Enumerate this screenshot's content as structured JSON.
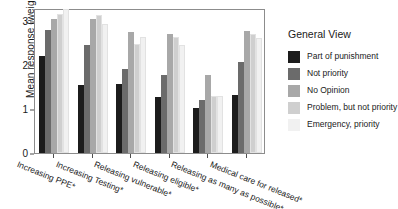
{
  "chart_data": {
    "type": "bar",
    "title": "",
    "xlabel": "",
    "ylabel": "Mean response (weighted)",
    "ylim": [
      0,
      3.3
    ],
    "yticks": [
      0,
      1,
      2,
      3
    ],
    "ytick_labels": [
      "0",
      "1",
      "2",
      "3"
    ],
    "grid": false,
    "legend_position": "right",
    "legend_title": "General View",
    "categories": [
      "Increasing PPE*",
      "Increasing Testing*",
      "Releasing vulnerable*",
      "Releasing eligible*",
      "Releasing as many as possible*",
      "Medical care for released*"
    ],
    "series": [
      {
        "name": "Part of punishment",
        "color": "#1c1c1c",
        "values": [
          2.2,
          1.55,
          1.58,
          1.28,
          1.02,
          1.32
        ]
      },
      {
        "name": "Not priority",
        "color": "#6b6b6b",
        "values": [
          2.79,
          2.45,
          1.91,
          1.77,
          1.2,
          2.08
        ]
      },
      {
        "name": "No Opinion",
        "color": "#a8a8a8",
        "values": [
          3.05,
          3.05,
          2.75,
          2.72,
          1.78,
          2.78
        ]
      },
      {
        "name": "Problem, but not priority",
        "color": "#cfcfcf",
        "values": [
          3.16,
          3.15,
          2.47,
          2.63,
          1.3,
          2.7
        ]
      },
      {
        "name": "Emergency, priority",
        "color": "#f1f1f1",
        "values": [
          3.27,
          2.93,
          2.63,
          2.46,
          1.3,
          2.61
        ]
      }
    ]
  },
  "legend": {
    "title": "General View",
    "items": [
      {
        "label": "Part of punishment",
        "color": "#1c1c1c"
      },
      {
        "label": "Not priority",
        "color": "#6b6b6b"
      },
      {
        "label": "No Opinion",
        "color": "#a8a8a8"
      },
      {
        "label": "Problem, but not priority",
        "color": "#cfcfcf"
      },
      {
        "label": "Emergency, priority",
        "color": "#f1f1f1"
      }
    ]
  },
  "axes": {
    "y_title": "Mean response (weighted)"
  }
}
